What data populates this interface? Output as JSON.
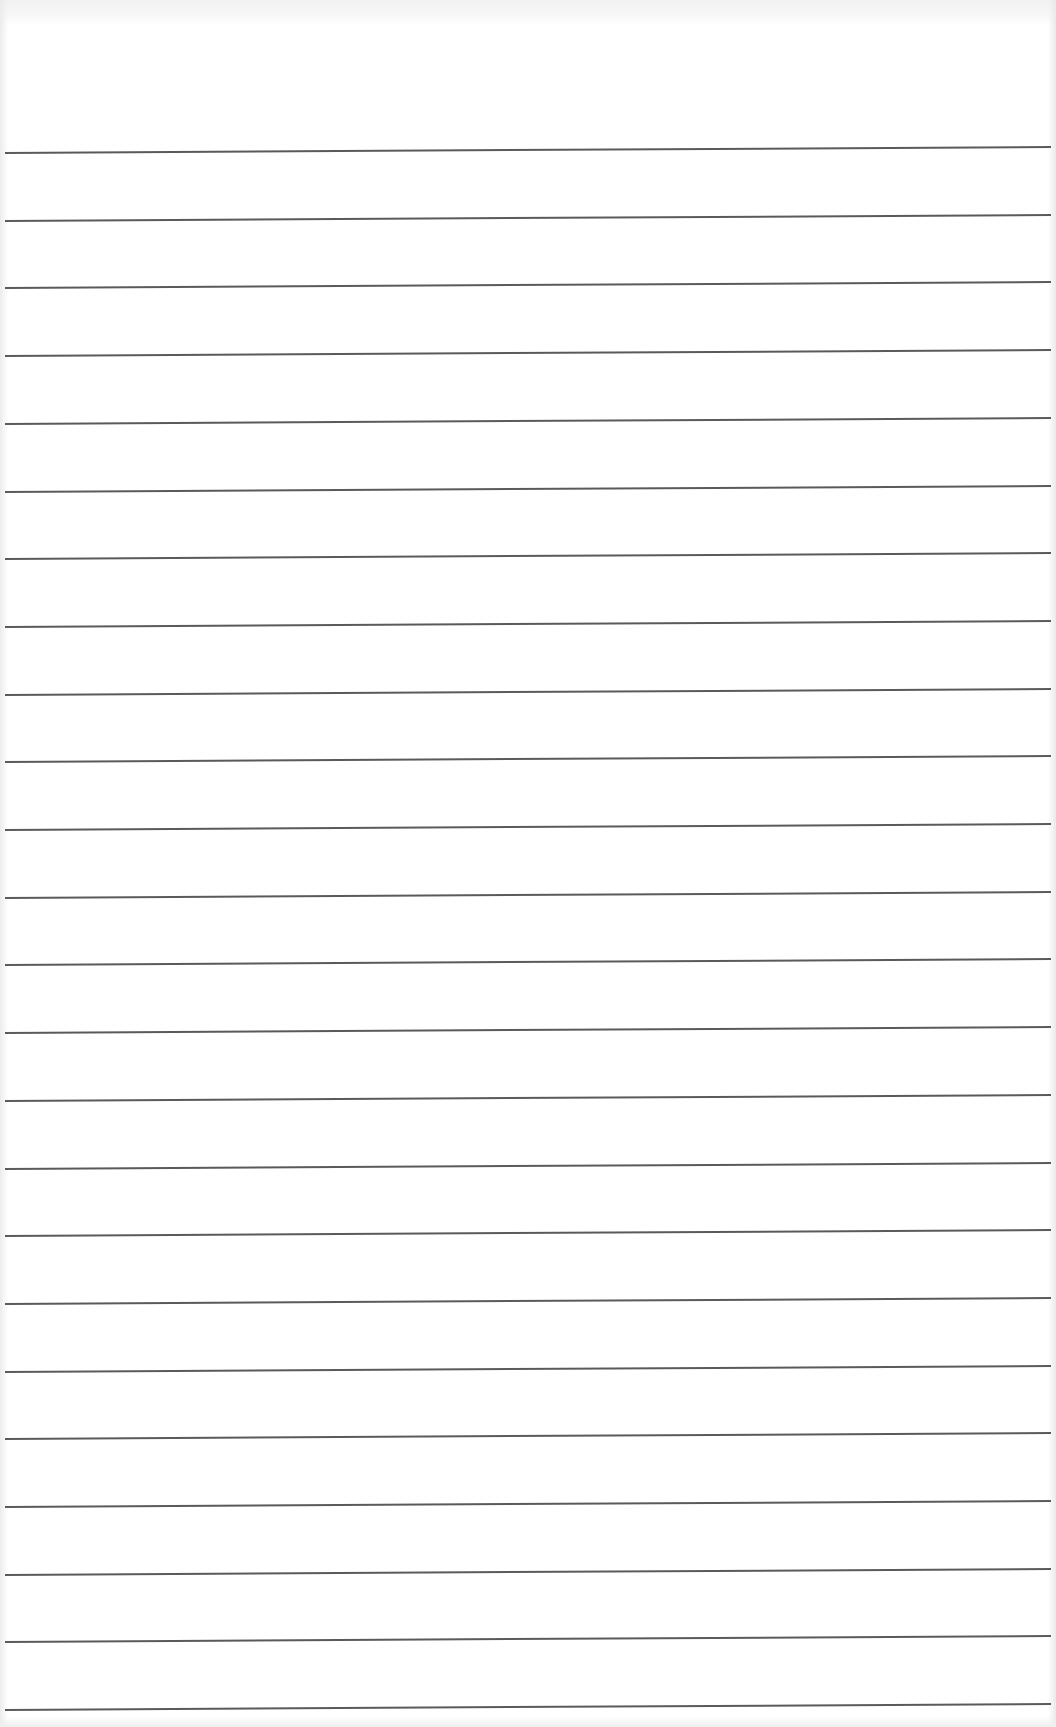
{
  "document": {
    "type": "ruled-paper",
    "line_count": 24,
    "first_line_y": 149,
    "line_spacing": 67.7,
    "line_color": "#5a5a5a",
    "paper_color": "#ffffff",
    "text": ""
  }
}
